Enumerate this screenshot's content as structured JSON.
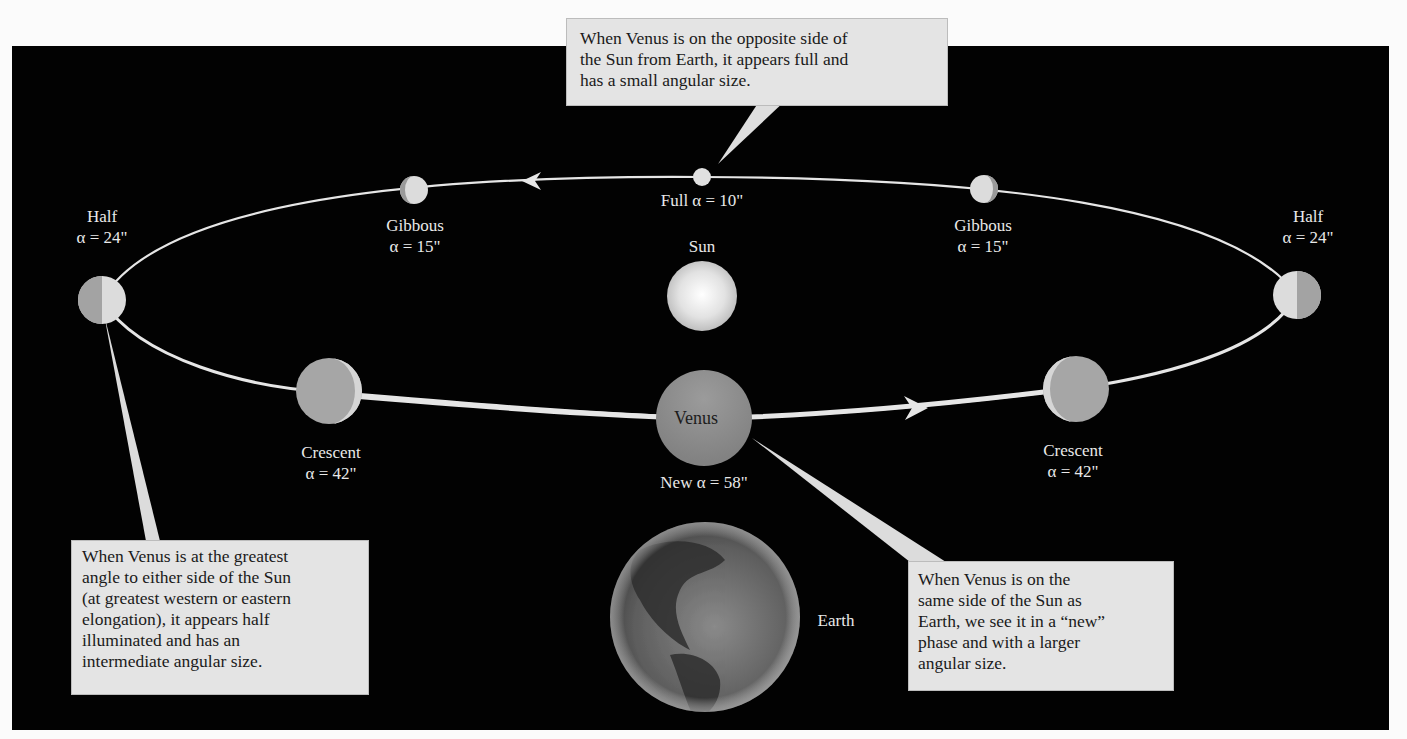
{
  "diagram": {
    "colors": {
      "background": "#020202",
      "orbit": "#e8e8e8",
      "callout_fill": "#e4e4e4",
      "label_text": "#e9e9e9"
    },
    "center_body": {
      "name": "Sun",
      "label": "Sun"
    },
    "observer": {
      "name": "Earth",
      "label": "Earth"
    },
    "venus_label": "Venus",
    "positions": [
      {
        "id": "half-left",
        "phase": "Half",
        "angular_size": "α = 24\""
      },
      {
        "id": "gibbous-left",
        "phase": "Gibbous",
        "angular_size": "α = 15\""
      },
      {
        "id": "full",
        "phase": "Full",
        "angular_size": "α = 10\"",
        "combined": "Full α = 10\""
      },
      {
        "id": "gibbous-right",
        "phase": "Gibbous",
        "angular_size": "α = 15\""
      },
      {
        "id": "half-right",
        "phase": "Half",
        "angular_size": "α = 24\""
      },
      {
        "id": "crescent-right",
        "phase": "Crescent",
        "angular_size": "α = 42\""
      },
      {
        "id": "new",
        "phase": "New",
        "angular_size": "α = 58\"",
        "combined": "New α = 58\""
      },
      {
        "id": "crescent-left",
        "phase": "Crescent",
        "angular_size": "α = 42\""
      }
    ],
    "callouts": {
      "top": {
        "lines": [
          "When Venus is on the opposite side of",
          "the Sun from Earth, it appears full and",
          "has a small angular size."
        ]
      },
      "left": {
        "lines": [
          "When Venus is at the greatest",
          "angle to either side of the Sun",
          "(at greatest western or eastern",
          "elongation), it appears half",
          "illuminated and has an",
          "intermediate angular size."
        ]
      },
      "right": {
        "lines": [
          "When Venus is on the",
          "same side of the Sun as",
          "Earth, we see it in a “new”",
          "phase and with a larger",
          "angular size."
        ]
      }
    }
  }
}
